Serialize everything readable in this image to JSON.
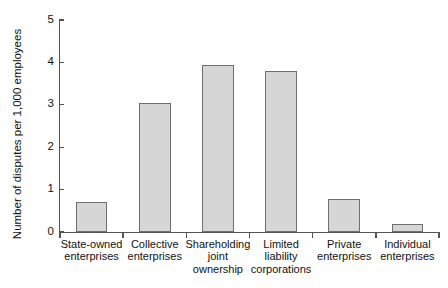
{
  "chart_data": {
    "type": "bar",
    "title": "",
    "subtitle": "",
    "xlabel": "",
    "ylabel": "Number of disputes per 1,000 employees",
    "ylim": [
      0,
      5
    ],
    "yticks": [
      0,
      1,
      2,
      3,
      4,
      5
    ],
    "ytick_labels": [
      "0",
      "1",
      "2",
      "3",
      "4",
      "5"
    ],
    "grid": false,
    "legend": null,
    "categories": [
      "State-owned enterprises",
      "Collective enterprises",
      "Shareholding joint ownership",
      "Limited liability corporations",
      "Private enterprises",
      "Individual enterprises"
    ],
    "category_lines": [
      [
        "State-owned",
        "enterprises"
      ],
      [
        "Collective",
        "enterprises"
      ],
      [
        "Shareholding",
        "joint",
        "ownership"
      ],
      [
        "Limited",
        "liability",
        "corporations"
      ],
      [
        "Private",
        "enterprises"
      ],
      [
        "Individual",
        "enterprises"
      ]
    ],
    "values": [
      0.7,
      3.05,
      3.95,
      3.8,
      0.78,
      0.2
    ],
    "bar_color": "#d6d6d6",
    "bar_border_color": "#6f6f6f",
    "axis_color": "#555555"
  }
}
